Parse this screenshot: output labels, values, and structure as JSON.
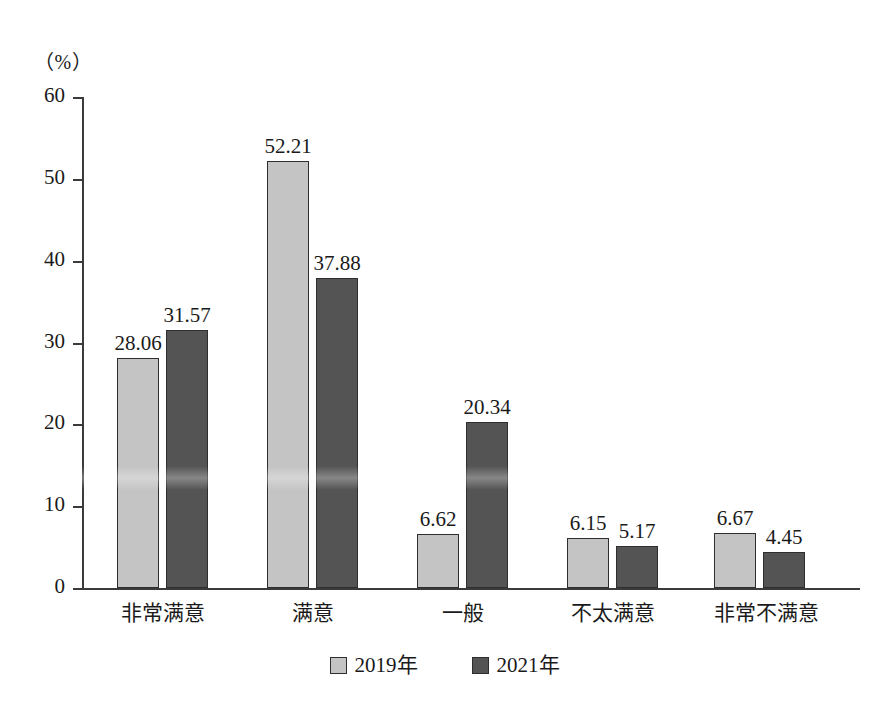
{
  "chart_data": {
    "type": "bar",
    "title": "",
    "subtitle": "",
    "xlabel": "",
    "ylabel": "",
    "unit_label": "（%）",
    "categories": [
      "非常满意",
      "满意",
      "一般",
      "不太满意",
      "非常不满意"
    ],
    "series": [
      {
        "name": "2019年",
        "color": "#c4c4c4",
        "values": [
          28.06,
          52.21,
          6.62,
          6.15,
          6.67
        ]
      },
      {
        "name": "2021年",
        "color": "#545454",
        "values": [
          31.57,
          37.88,
          20.34,
          5.17,
          4.45
        ]
      }
    ],
    "value_labels": [
      [
        "28.06",
        "52.21",
        "6.62",
        "6.15",
        "6.67"
      ],
      [
        "31.57",
        "37.88",
        "20.34",
        "5.17",
        "4.45"
      ]
    ],
    "ylim": [
      0,
      60
    ],
    "yticks": [
      0,
      10,
      20,
      30,
      40,
      50,
      60
    ],
    "ytick_labels": [
      "0",
      "10",
      "20",
      "30",
      "40",
      "50",
      "60"
    ],
    "grid": false,
    "legend_position": "bottom"
  },
  "legend": {
    "items": [
      {
        "label": "2019年",
        "color": "#c4c4c4"
      },
      {
        "label": "2021年",
        "color": "#545454"
      }
    ]
  }
}
